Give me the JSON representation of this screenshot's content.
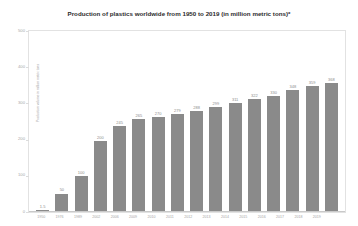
{
  "chart_data": {
    "type": "bar",
    "title": "Production of plastics worldwide from 1950 to 2019 (in million metric tons)*",
    "xlabel": "",
    "ylabel": "Production volume in million metric tons",
    "ylim": [
      0,
      500
    ],
    "yticks": [
      0,
      100,
      200,
      300,
      400,
      500
    ],
    "ytick_labels": [
      "0",
      "100",
      "200",
      "300",
      "400",
      "500"
    ],
    "grid": false,
    "legend": false,
    "bar_color": "#8a8a8a",
    "categories": [
      "1950",
      "1976",
      "1989",
      "2002",
      "2006",
      "2009",
      "2010",
      "2011",
      "2012",
      "2013",
      "2014",
      "2015",
      "2016",
      "2017",
      "2018",
      "2019"
    ],
    "values": [
      1.5,
      50,
      100,
      200,
      245,
      265,
      270,
      279,
      288,
      299,
      311,
      322,
      330,
      348,
      359,
      368
    ],
    "value_labels": [
      "1.5",
      "50",
      "100",
      "200",
      "245",
      "265",
      "270",
      "279",
      "288",
      "299",
      "311",
      "322",
      "330",
      "348",
      "359",
      "368"
    ]
  }
}
